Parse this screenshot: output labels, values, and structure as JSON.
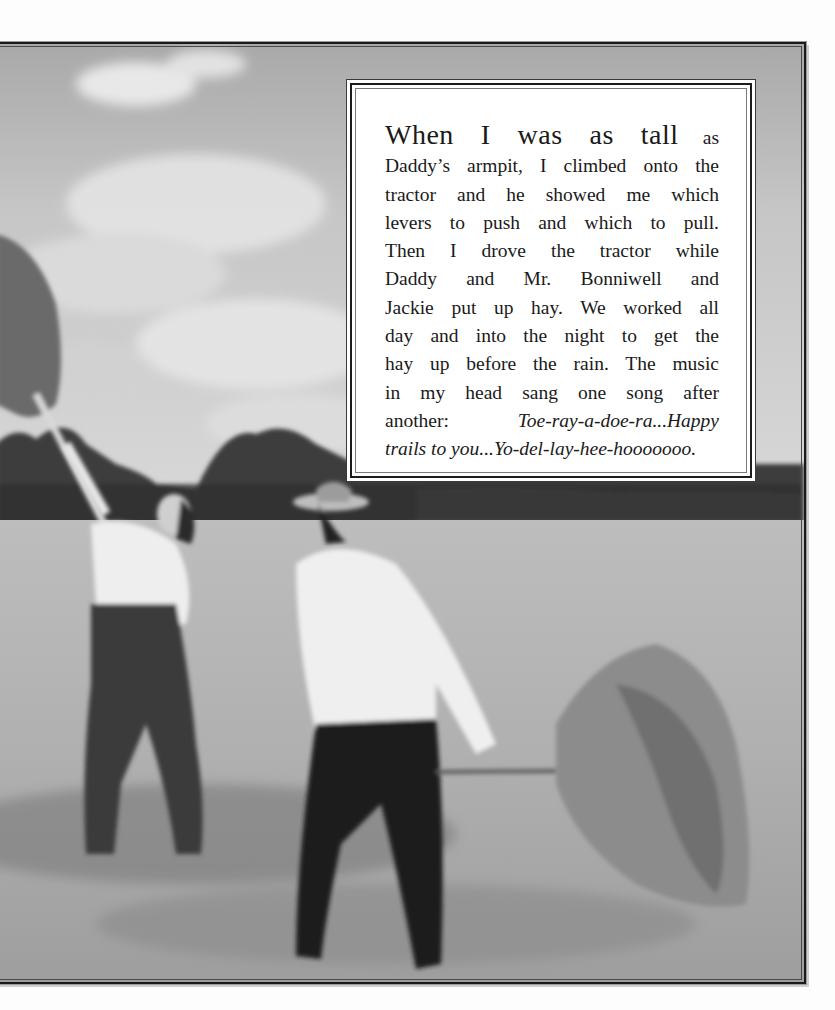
{
  "page": {
    "type": "picture-book-spread",
    "background": "#fdfdfd"
  },
  "illustration": {
    "description": "Grayscale painting of two men pitching hay in a field under a cloudy sky, trees along the horizon, a haystack on the right",
    "figures": [
      {
        "label": "young man in overalls lifting pitchfork of hay overhead",
        "position": "left"
      },
      {
        "label": "man in straw hat and white shirt forking hay",
        "position": "center"
      }
    ],
    "frame_color": "#1a1a1a"
  },
  "story": {
    "lead": "When I was as tall",
    "lines": [
      "as",
      "Daddy’s armpit, I climbed onto the",
      "tractor and he showed me which",
      "levers to push and which to pull.",
      "Then I drove the tractor while",
      "Daddy and Mr. Bonniwell and",
      "Jackie put up hay. We worked all",
      "day and into the night to get the",
      "hay up before the rain. The music",
      "in my head sang one song after",
      "another:"
    ],
    "song_lyrics_1": "Toe-ray-a-doe-ra...Happy",
    "song_lyrics_2": "trails to you...Yo-del-lay-hee-hooooooo."
  }
}
